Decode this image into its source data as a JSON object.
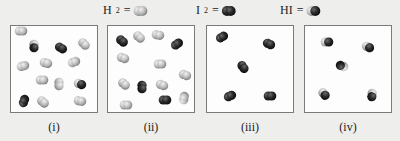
{
  "legend": [
    {
      "formula": "H",
      "sub": "2",
      "suffix": " = ",
      "molecule": "H2",
      "x": 103
    },
    {
      "formula": "I",
      "sub": "2",
      "suffix": " = ",
      "molecule": "I2",
      "x": 196
    },
    {
      "formula": "HI",
      "sub": "",
      "suffix": " = ",
      "molecule": "HI",
      "x": 280
    }
  ],
  "colors": {
    "H": "#b8b8b8",
    "I": "#222222",
    "border": "#7a7a7a"
  },
  "boxes": [
    {
      "label": "(i)",
      "x": 10,
      "w": 88,
      "molecules": [
        {
          "t": "H2",
          "x": 21,
          "y": 31,
          "a": 0
        },
        {
          "t": "HI",
          "x": 34,
          "y": 46,
          "a": 90
        },
        {
          "t": "I2",
          "x": 61,
          "y": 48,
          "a": 30
        },
        {
          "t": "H2",
          "x": 84,
          "y": 44,
          "a": 45
        },
        {
          "t": "H2",
          "x": 23,
          "y": 66,
          "a": -15
        },
        {
          "t": "H2",
          "x": 46,
          "y": 63,
          "a": 15
        },
        {
          "t": "H2",
          "x": 74,
          "y": 62,
          "a": -20
        },
        {
          "t": "H2",
          "x": 42,
          "y": 80,
          "a": 0
        },
        {
          "t": "H2",
          "x": 59,
          "y": 84,
          "a": 90
        },
        {
          "t": "HI",
          "x": 80,
          "y": 84,
          "a": 20
        },
        {
          "t": "I2",
          "x": 24,
          "y": 101,
          "a": -70
        },
        {
          "t": "H2",
          "x": 43,
          "y": 102,
          "a": 40
        },
        {
          "t": "H2",
          "x": 80,
          "y": 101,
          "a": 10
        }
      ]
    },
    {
      "label": "(ii)",
      "x": 107,
      "w": 88,
      "molecules": [
        {
          "t": "I2",
          "x": 122,
          "y": 41,
          "a": 40
        },
        {
          "t": "H2",
          "x": 139,
          "y": 37,
          "a": 40
        },
        {
          "t": "H2",
          "x": 158,
          "y": 35,
          "a": 10
        },
        {
          "t": "I2",
          "x": 177,
          "y": 44,
          "a": -35
        },
        {
          "t": "H2",
          "x": 123,
          "y": 58,
          "a": 20
        },
        {
          "t": "H2",
          "x": 160,
          "y": 64,
          "a": 0
        },
        {
          "t": "H2",
          "x": 185,
          "y": 75,
          "a": 20
        },
        {
          "t": "H2",
          "x": 124,
          "y": 84,
          "a": 40
        },
        {
          "t": "I2",
          "x": 142,
          "y": 87,
          "a": 90
        },
        {
          "t": "H2",
          "x": 162,
          "y": 85,
          "a": 20
        },
        {
          "t": "I2",
          "x": 165,
          "y": 100,
          "a": 0
        },
        {
          "t": "H2",
          "x": 184,
          "y": 98,
          "a": -80
        },
        {
          "t": "H2",
          "x": 126,
          "y": 105,
          "a": 0
        }
      ]
    },
    {
      "label": "(iii)",
      "x": 206,
      "w": 88,
      "molecules": [
        {
          "t": "I2",
          "x": 222,
          "y": 37,
          "a": -30
        },
        {
          "t": "I2",
          "x": 269,
          "y": 44,
          "a": 25
        },
        {
          "t": "I2",
          "x": 243,
          "y": 67,
          "a": 55
        },
        {
          "t": "I2",
          "x": 230,
          "y": 96,
          "a": -25
        },
        {
          "t": "I2",
          "x": 270,
          "y": 96,
          "a": 0
        }
      ]
    },
    {
      "label": "(iv)",
      "x": 304,
      "w": 88,
      "molecules": [
        {
          "t": "HI",
          "x": 327,
          "y": 42,
          "a": 0
        },
        {
          "t": "HI",
          "x": 368,
          "y": 47,
          "a": 25
        },
        {
          "t": "HI",
          "x": 342,
          "y": 66,
          "a": 200
        },
        {
          "t": "HI",
          "x": 324,
          "y": 94,
          "a": 50
        },
        {
          "t": "HI",
          "x": 372,
          "y": 95,
          "a": 95
        }
      ]
    }
  ]
}
